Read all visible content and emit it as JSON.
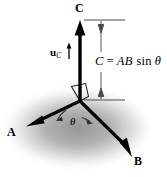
{
  "figure": {
    "colors": {
      "background": "#ffffff",
      "vector_stroke": "#000000",
      "plane_shadow": "#9a9a9a",
      "dimension_line": "#555555",
      "text": "#000000"
    },
    "labels": {
      "vector_c": "C",
      "vector_a": "A",
      "vector_b": "B",
      "unit_vector_u": "u",
      "unit_vector_subscript": "C",
      "angle": "θ",
      "magnitude_lhs": "C",
      "magnitude_equals": "=",
      "magnitude_factors": "AB",
      "magnitude_function": "sin",
      "magnitude_angle": "θ",
      "magnitude_full": "C = AB sin θ"
    },
    "geometry": {
      "origin_x": 80,
      "origin_y": 101,
      "c_tip_x": 80,
      "c_tip_y": 22,
      "a_tip_x": 27,
      "a_tip_y": 125,
      "b_tip_x": 131,
      "b_tip_y": 157,
      "dimension_line_x": 101,
      "dimension_top_y": 20,
      "dimension_bottom_y": 100
    }
  }
}
